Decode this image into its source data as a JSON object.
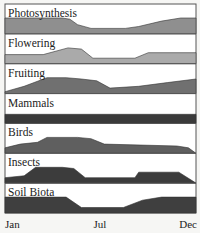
{
  "chart_data": {
    "type": "area",
    "title": "",
    "xlabel": "",
    "ylabel": "",
    "x_ticks": [
      "Jan",
      "Jul",
      "Dec"
    ],
    "x_range_percent": [
      0,
      100
    ],
    "panel_height": 30,
    "grid": false,
    "legend": "none (panel labels inline)",
    "series": [
      {
        "name": "Photosynthesis",
        "color": "#8f8f8f",
        "points": [
          [
            0,
            9
          ],
          [
            30,
            9
          ],
          [
            34,
            8
          ],
          [
            38,
            5
          ],
          [
            45,
            3
          ],
          [
            63,
            3
          ],
          [
            70,
            4
          ],
          [
            82,
            7
          ],
          [
            92,
            10
          ],
          [
            100,
            10
          ]
        ]
      },
      {
        "name": "Flowering",
        "color": "#aaaaaa",
        "points": [
          [
            0,
            5
          ],
          [
            20,
            5
          ],
          [
            33,
            13
          ],
          [
            40,
            8
          ],
          [
            46,
            3
          ],
          [
            68,
            3
          ],
          [
            75,
            6
          ],
          [
            100,
            6
          ]
        ]
      },
      {
        "name": "Fruiting",
        "color": "#707070",
        "points": [
          [
            0,
            1
          ],
          [
            10,
            4
          ],
          [
            22,
            9
          ],
          [
            32,
            10
          ],
          [
            40,
            8
          ],
          [
            48,
            7
          ],
          [
            55,
            3
          ],
          [
            70,
            4
          ],
          [
            85,
            6
          ],
          [
            100,
            8
          ]
        ]
      },
      {
        "name": "Mammals",
        "color": "#3a3a3a",
        "points": [
          [
            0,
            5
          ],
          [
            100,
            5
          ]
        ]
      },
      {
        "name": "Birds",
        "color": "#5f5f5f",
        "points": [
          [
            0,
            3
          ],
          [
            8,
            5
          ],
          [
            17,
            6
          ],
          [
            22,
            11
          ],
          [
            38,
            11
          ],
          [
            45,
            8
          ],
          [
            52,
            5
          ],
          [
            90,
            4
          ],
          [
            96,
            3
          ],
          [
            100,
            0
          ]
        ]
      },
      {
        "name": "Insects",
        "color": "#3c3c3c",
        "points": [
          [
            0,
            3
          ],
          [
            10,
            4
          ],
          [
            16,
            9
          ],
          [
            20,
            11
          ],
          [
            30,
            11
          ],
          [
            36,
            8
          ],
          [
            42,
            3
          ],
          [
            68,
            3
          ],
          [
            70,
            6
          ],
          [
            91,
            6
          ],
          [
            100,
            0
          ]
        ]
      },
      {
        "name": "Soil Biota",
        "color": "#3f3f3f",
        "points": [
          [
            0,
            13
          ],
          [
            25,
            14
          ],
          [
            32,
            11
          ],
          [
            40,
            3
          ],
          [
            62,
            3
          ],
          [
            72,
            7
          ],
          [
            82,
            10
          ],
          [
            100,
            14
          ]
        ]
      }
    ]
  }
}
